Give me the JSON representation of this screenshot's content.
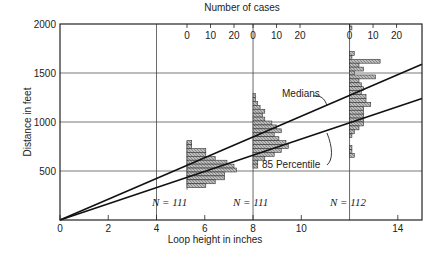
{
  "chart_data": {
    "type": "line",
    "title": "",
    "xlabel": "Loop height in inches",
    "ylabel": "Distance in feet",
    "top_axis_label": "Number of cases",
    "xlim": [
      0,
      15
    ],
    "ylim": [
      0,
      2000
    ],
    "x_ticks": [
      "0",
      "2",
      "4",
      "6",
      "8",
      "10",
      "14"
    ],
    "y_ticks": [
      "500",
      "1000",
      "1500",
      "2000"
    ],
    "grid": true,
    "series": [
      {
        "name": "Medians",
        "x": [
          0,
          15
        ],
        "y": [
          0,
          1590
        ]
      },
      {
        "name": "85 Percentile",
        "x": [
          0,
          15
        ],
        "y": [
          0,
          1240
        ]
      }
    ],
    "histograms": [
      {
        "loop_height": 5.3,
        "N_label": "N = 111",
        "top_ticks": [
          "0",
          "10",
          "20"
        ],
        "bins_ft": [
          790,
          750,
          710,
          670,
          630,
          590,
          550,
          510,
          470,
          430,
          390,
          350
        ],
        "counts": [
          2,
          2,
          8,
          8,
          12,
          17,
          20,
          21,
          16,
          16,
          12,
          8
        ]
      },
      {
        "loop_height": 8,
        "N_label": "N = 111",
        "top_ticks": [
          "0",
          "10",
          "20"
        ],
        "bins_ft": [
          1270,
          1230,
          1190,
          1150,
          1110,
          1070,
          1030,
          990,
          950,
          910,
          870,
          830,
          790,
          750,
          710,
          670,
          630,
          590,
          550
        ],
        "counts": [
          1,
          1,
          2,
          3,
          5,
          4,
          5,
          8,
          10,
          12,
          9,
          11,
          14,
          15,
          12,
          9,
          5,
          2,
          2
        ]
      },
      {
        "loop_height": 12,
        "N_label": "N = 112",
        "top_ticks": [
          "0",
          "10",
          "20"
        ],
        "bins_ft": [
          1960,
          1700,
          1660,
          1620,
          1580,
          1540,
          1500,
          1460,
          1420,
          1380,
          1340,
          1300,
          1260,
          1220,
          1180,
          1140,
          1100,
          1060,
          1020,
          980,
          940,
          900,
          860,
          820,
          780,
          740,
          700,
          660,
          620
        ],
        "counts": [
          1,
          2,
          1,
          13,
          4,
          6,
          2,
          11,
          4,
          5,
          6,
          5,
          7,
          7,
          9,
          6,
          6,
          6,
          6,
          6,
          4,
          2,
          1,
          0,
          0,
          1,
          1,
          2,
          0
        ]
      }
    ],
    "annotations": [
      "Medians",
      "85 Percentile",
      "N = 111",
      "N = 111",
      "N = 112"
    ]
  },
  "labels": {
    "top": "Number of cases",
    "x": "Loop height in inches",
    "y": "Distance in feet",
    "medians": "Medians",
    "p85": "85 Percentile",
    "n1": "N = 111",
    "n2": "N = 111",
    "n3": "N = 112"
  }
}
